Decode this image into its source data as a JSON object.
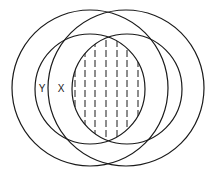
{
  "diagram": {
    "type": "venn",
    "stroke_color": "#1a1a1a",
    "background": "#ffffff",
    "circles": [
      {
        "id": "outer-left",
        "cx": 90,
        "cy": 88,
        "r": 78
      },
      {
        "id": "outer-right",
        "cx": 126,
        "cy": 88,
        "r": 78
      },
      {
        "id": "inner-left",
        "cx": 90,
        "cy": 89,
        "r": 55
      },
      {
        "id": "inner-right",
        "cx": 127,
        "cy": 89,
        "r": 55
      }
    ],
    "labels": [
      {
        "id": "Y",
        "text": "Y",
        "x": 42,
        "y": 92
      },
      {
        "id": "X",
        "text": "X",
        "x": 61,
        "y": 92
      }
    ],
    "shaded_region": {
      "description": "intersection of inner-left and inner-right circles",
      "pattern": "vertical dashed lines",
      "line_x": [
        75,
        85,
        95,
        106,
        117,
        127,
        138
      ]
    }
  }
}
